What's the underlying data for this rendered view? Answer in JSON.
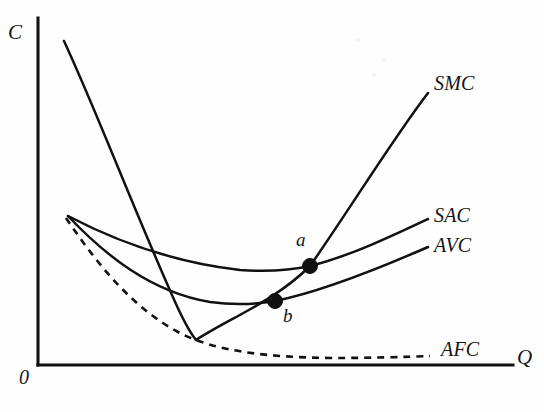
{
  "figure": {
    "background_color": "#fefefe",
    "ink_color": "#111111"
  },
  "axes": {
    "y_label": "C",
    "x_label": "Q",
    "origin_label": "0"
  },
  "curve_labels": {
    "smc": "SMC",
    "sac": "SAC",
    "avc": "AVC",
    "afc": "AFC"
  },
  "point_labels": {
    "a": "a",
    "b": "b"
  },
  "chart_data": {
    "type": "line",
    "title": "",
    "xlabel": "Q",
    "ylabel": "C",
    "grid": false,
    "legend": "inline-right-end-labels",
    "axis_style": "two-axis-no-ticks",
    "xlim": [
      0,
      1
    ],
    "ylim": [
      0,
      1
    ],
    "series": [
      {
        "name": "SMC",
        "style": "solid",
        "label": "SMC",
        "path": "M 64 41 C 96 110, 130 200, 172 295 C 182 318, 188 330, 196 340 C 230 318, 275 301, 310 266 C 348 212, 392 140, 428 93",
        "points_px": [
          [
            64,
            41
          ],
          [
            90,
            100
          ],
          [
            115,
            160
          ],
          [
            145,
            230
          ],
          [
            172,
            295
          ],
          [
            185,
            330
          ],
          [
            196,
            340
          ],
          [
            230,
            318
          ],
          [
            275,
            301
          ],
          [
            310,
            266
          ],
          [
            360,
            190
          ],
          [
            428,
            93
          ]
        ]
      },
      {
        "name": "SAC",
        "style": "solid",
        "label": "SAC",
        "path": "M 68 216 C 110 238, 170 262, 240 270 C 270 272, 292 270, 310 266 C 350 256, 392 236, 428 219",
        "points_px": [
          [
            68,
            216
          ],
          [
            120,
            243
          ],
          [
            180,
            262
          ],
          [
            240,
            270
          ],
          [
            275,
            270
          ],
          [
            310,
            266
          ],
          [
            370,
            243
          ],
          [
            428,
            219
          ]
        ]
      },
      {
        "name": "AVC",
        "style": "solid",
        "label": "AVC",
        "path": "M 68 216 C 104 254, 150 292, 210 302 C 238 306, 258 304, 275 301 C 320 292, 380 268, 428 247",
        "points_px": [
          [
            68,
            216
          ],
          [
            120,
            270
          ],
          [
            170,
            298
          ],
          [
            210,
            302
          ],
          [
            245,
            303
          ],
          [
            275,
            301
          ],
          [
            350,
            275
          ],
          [
            428,
            247
          ]
        ]
      },
      {
        "name": "AFC",
        "style": "dashed",
        "label": "AFC",
        "path": "M 66 218 C 96 262, 130 306, 178 332 C 216 352, 268 357, 330 358 C 372 358, 404 357, 430 356",
        "points_px": [
          [
            66,
            218
          ],
          [
            110,
            282
          ],
          [
            150,
            318
          ],
          [
            190,
            340
          ],
          [
            240,
            352
          ],
          [
            300,
            357
          ],
          [
            370,
            357
          ],
          [
            430,
            356
          ]
        ]
      }
    ],
    "annotations": [
      {
        "label": "a",
        "meaning": "SMC intersects SAC at minimum of SAC",
        "x_px": 310,
        "y_px": 266,
        "label_x_px": 296,
        "label_y_px": 233
      },
      {
        "label": "b",
        "meaning": "SMC intersects AVC at minimum of AVC",
        "x_px": 275,
        "y_px": 301,
        "label_x_px": 283,
        "label_y_px": 308
      }
    ],
    "axis_geometry": {
      "y_axis_x_px": 38,
      "y_axis_top_px": 18,
      "x_axis_y_px": 365,
      "x_axis_right_px": 513
    }
  }
}
